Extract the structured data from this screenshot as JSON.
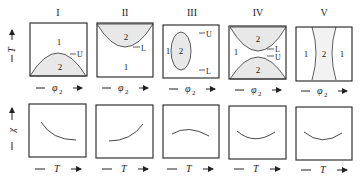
{
  "figure": {
    "columns": [
      {
        "id": "I",
        "title": "I"
      },
      {
        "id": "II",
        "title": "II"
      },
      {
        "id": "III",
        "title": "III"
      },
      {
        "id": "IV",
        "title": "IV"
      },
      {
        "id": "V",
        "title": "V"
      }
    ],
    "top_row": {
      "y_axis_label": "T",
      "x_axis_label": "φ",
      "x_axis_subscript": "2",
      "panels": [
        {
          "regions": [
            "1",
            "2"
          ],
          "markers": [
            "U"
          ]
        },
        {
          "regions": [
            "2",
            "1"
          ],
          "markers": [
            "L"
          ]
        },
        {
          "regions": [
            "1",
            "2"
          ],
          "markers": [
            "U",
            "L"
          ]
        },
        {
          "regions": [
            "2",
            "1",
            "2"
          ],
          "markers": [
            "L",
            "U"
          ]
        },
        {
          "regions": [
            "1",
            "2",
            "1"
          ],
          "markers": []
        }
      ]
    },
    "bottom_row": {
      "y_axis_label": "χ",
      "x_axis_label": "T",
      "curves": [
        "decreasing-convex",
        "increasing-convex",
        "concave-maximum",
        "convex-minimum",
        "convex-minimum"
      ]
    },
    "colors": {
      "line": "#333333",
      "shade": "#e8e8e8"
    }
  }
}
